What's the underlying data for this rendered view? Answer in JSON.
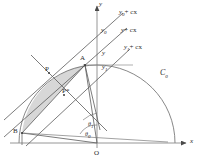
{
  "figure": {
    "type": "geometry-diagram",
    "background": "#ffffff",
    "stroke_color": "#4a4a4a",
    "fill_color": "#d5d5d5",
    "width": 204,
    "height": 164
  },
  "axes": {
    "x_label": "x",
    "y_label": "y",
    "origin_label": "O"
  },
  "curve": {
    "label": "C",
    "label_sub": "0",
    "description": "semicircle centred at origin"
  },
  "points": [
    {
      "name": "A",
      "label": "A"
    },
    {
      "name": "B",
      "label": "B"
    },
    {
      "name": "P",
      "label": "P"
    },
    {
      "name": "P-star",
      "label": "P*"
    },
    {
      "name": "O",
      "label": "O"
    }
  ],
  "lines": [
    {
      "name": "upper-parallel",
      "label": "y",
      "label_sub": "0",
      "label_tail": "+ cx"
    },
    {
      "name": "middle-parallel",
      "label": "y",
      "label_sub": "",
      "label_tail": "+ cx"
    },
    {
      "name": "lower-parallel",
      "label": "y",
      "label_sub": "1",
      "label_tail": "+ cx"
    }
  ],
  "intercepts": [
    {
      "name": "y0-intercept",
      "label": "y",
      "label_sub": "0"
    },
    {
      "name": "y-intercept",
      "label": "y",
      "label_sub": ""
    },
    {
      "name": "y1-intercept",
      "label": "y",
      "label_sub": "1"
    }
  ],
  "angles": [
    {
      "name": "theta-1",
      "label": "θ",
      "label_sub": "1"
    },
    {
      "name": "theta-0",
      "label": "θ",
      "label_sub": "0"
    }
  ]
}
